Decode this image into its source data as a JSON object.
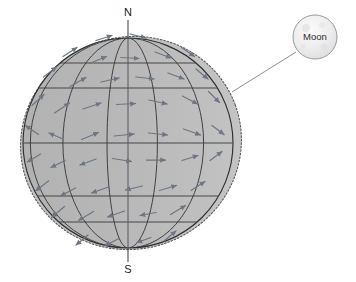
{
  "diagram": {
    "type": "tidal-force-field",
    "background_color": "#ffffff",
    "canvas": {
      "width": 356,
      "height": 282
    }
  },
  "labels": {
    "north_pole": "N",
    "south_pole": "S",
    "moon": "Moon"
  },
  "colors": {
    "sphere_fill": "#b7b7b7",
    "bulge_fill": "#c4c4c4",
    "grid_line": "#3a3a3a",
    "outline_dotted": "#555555",
    "arrow": "#6d7682",
    "axis_line": "#4a4a4a",
    "moon_fill": "#eeeeee",
    "moon_stroke": "#9a9a9a",
    "connector_line": "#8a8a8a",
    "label_text": "#1a1a1a"
  },
  "geometry": {
    "sphere": {
      "cx": 128,
      "cy": 143,
      "r": 105
    },
    "bulge": {
      "cx": 131,
      "cy": 143,
      "rx": 111,
      "ry": 106,
      "rotation_deg": -20
    },
    "moon": {
      "cx": 315,
      "cy": 37,
      "r": 22
    },
    "connector": {
      "x1": 232,
      "y1": 92,
      "x2": 296,
      "y2": 52
    },
    "axis": {
      "x": 128,
      "y_top": 20,
      "y_bottom": 262
    },
    "north_label_pos": {
      "x": 128,
      "y": 13
    },
    "south_label_pos": {
      "x": 128,
      "y": 270
    }
  },
  "grid": {
    "latitude_lines_y": [
      88,
      143,
      196
    ],
    "latitude_line_top_y": 63,
    "latitude_line_bottom_y": 222,
    "meridian_count": 5,
    "meridian_offsets": [
      -0.93,
      -0.62,
      -0.2,
      0.28,
      0.72
    ]
  },
  "chart_data": {
    "type": "scatter",
    "xlabel": "",
    "ylabel": "",
    "legend": [],
    "annotations": [
      {
        "text": "N",
        "meaning": "north-pole"
      },
      {
        "text": "S",
        "meaning": "south-pole"
      },
      {
        "text": "Moon",
        "meaning": "tide-raising-body"
      }
    ],
    "vectors": [
      {
        "x": 104,
        "y": 38,
        "dx": 16,
        "dy": -5
      },
      {
        "x": 138,
        "y": 36,
        "dx": 16,
        "dy": 4
      },
      {
        "x": 70,
        "y": 52,
        "dx": 14,
        "dy": -9
      },
      {
        "x": 98,
        "y": 60,
        "dx": 17,
        "dy": -7
      },
      {
        "x": 130,
        "y": 58,
        "dx": 18,
        "dy": 1
      },
      {
        "x": 163,
        "y": 55,
        "dx": 16,
        "dy": 6
      },
      {
        "x": 188,
        "y": 52,
        "dx": 13,
        "dy": 9
      },
      {
        "x": 50,
        "y": 72,
        "dx": 13,
        "dy": -10
      },
      {
        "x": 78,
        "y": 82,
        "dx": 16,
        "dy": -9
      },
      {
        "x": 110,
        "y": 80,
        "dx": 18,
        "dy": -4
      },
      {
        "x": 145,
        "y": 78,
        "dx": 18,
        "dy": 2
      },
      {
        "x": 176,
        "y": 76,
        "dx": 16,
        "dy": 6
      },
      {
        "x": 202,
        "y": 74,
        "dx": 12,
        "dy": 10
      },
      {
        "x": 38,
        "y": 100,
        "dx": 12,
        "dy": -11
      },
      {
        "x": 62,
        "y": 108,
        "dx": 15,
        "dy": -10
      },
      {
        "x": 92,
        "y": 106,
        "dx": 18,
        "dy": -6
      },
      {
        "x": 126,
        "y": 104,
        "dx": 19,
        "dy": -1
      },
      {
        "x": 158,
        "y": 102,
        "dx": 18,
        "dy": 4
      },
      {
        "x": 190,
        "y": 100,
        "dx": 15,
        "dy": 8
      },
      {
        "x": 214,
        "y": 97,
        "dx": 11,
        "dy": 11
      },
      {
        "x": 32,
        "y": 130,
        "dx": -13,
        "dy": -9
      },
      {
        "x": 56,
        "y": 136,
        "dx": -14,
        "dy": -6
      },
      {
        "x": 90,
        "y": 136,
        "dx": 17,
        "dy": -7
      },
      {
        "x": 124,
        "y": 135,
        "dx": 20,
        "dy": -2
      },
      {
        "x": 158,
        "y": 134,
        "dx": 19,
        "dy": 2
      },
      {
        "x": 192,
        "y": 132,
        "dx": 17,
        "dy": 6
      },
      {
        "x": 218,
        "y": 130,
        "dx": 12,
        "dy": 9
      },
      {
        "x": 34,
        "y": 158,
        "dx": -13,
        "dy": 8
      },
      {
        "x": 58,
        "y": 164,
        "dx": -14,
        "dy": 7
      },
      {
        "x": 88,
        "y": 162,
        "dx": -16,
        "dy": 6
      },
      {
        "x": 122,
        "y": 160,
        "dx": 19,
        "dy": 3
      },
      {
        "x": 156,
        "y": 160,
        "dx": 19,
        "dy": 0
      },
      {
        "x": 190,
        "y": 158,
        "dx": 16,
        "dy": -5
      },
      {
        "x": 216,
        "y": 156,
        "dx": 12,
        "dy": -9
      },
      {
        "x": 42,
        "y": 186,
        "dx": -13,
        "dy": 10
      },
      {
        "x": 68,
        "y": 192,
        "dx": -15,
        "dy": 8
      },
      {
        "x": 100,
        "y": 190,
        "dx": -17,
        "dy": 6
      },
      {
        "x": 134,
        "y": 188,
        "dx": -17,
        "dy": 4
      },
      {
        "x": 168,
        "y": 188,
        "dx": 17,
        "dy": -5
      },
      {
        "x": 198,
        "y": 186,
        "dx": 14,
        "dy": -9
      },
      {
        "x": 58,
        "y": 212,
        "dx": -13,
        "dy": 11
      },
      {
        "x": 86,
        "y": 216,
        "dx": -15,
        "dy": 9
      },
      {
        "x": 116,
        "y": 214,
        "dx": -17,
        "dy": 6
      },
      {
        "x": 148,
        "y": 214,
        "dx": -16,
        "dy": 3
      },
      {
        "x": 178,
        "y": 210,
        "dx": 15,
        "dy": -9
      },
      {
        "x": 82,
        "y": 240,
        "dx": -12,
        "dy": 10
      },
      {
        "x": 112,
        "y": 242,
        "dx": -14,
        "dy": 7
      },
      {
        "x": 144,
        "y": 240,
        "dx": -14,
        "dy": 5
      },
      {
        "x": 170,
        "y": 236,
        "dx": 12,
        "dy": -10
      }
    ]
  }
}
